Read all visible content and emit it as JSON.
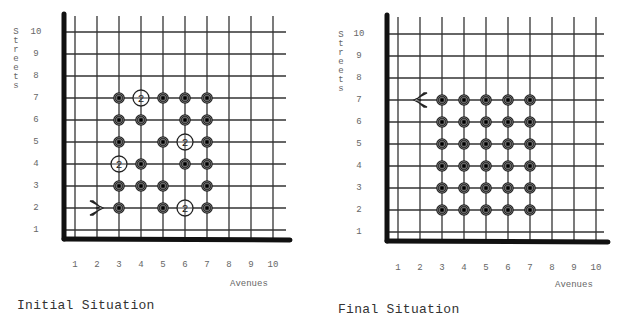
{
  "panels": {
    "initial": {
      "caption": "Initial Situation",
      "x_axis_title": "Avenues",
      "y_axis_title": "Streets",
      "x_ticks": [
        "1",
        "2",
        "3",
        "4",
        "5",
        "6",
        "7",
        "8",
        "9",
        "10"
      ],
      "y_ticks": [
        "1",
        "2",
        "3",
        "4",
        "5",
        "6",
        "7",
        "8",
        "9",
        "10"
      ],
      "robot": {
        "avenue": 2,
        "street": 2,
        "facing": "east",
        "icon": "robot-arrow-east-icon"
      },
      "beepers": [
        {
          "avenue": 3,
          "street": 7,
          "count": 1
        },
        {
          "avenue": 4,
          "street": 7,
          "count": 2
        },
        {
          "avenue": 5,
          "street": 7,
          "count": 1
        },
        {
          "avenue": 6,
          "street": 7,
          "count": 1
        },
        {
          "avenue": 7,
          "street": 7,
          "count": 1
        },
        {
          "avenue": 3,
          "street": 6,
          "count": 1
        },
        {
          "avenue": 4,
          "street": 6,
          "count": 1
        },
        {
          "avenue": 6,
          "street": 6,
          "count": 1
        },
        {
          "avenue": 7,
          "street": 6,
          "count": 1
        },
        {
          "avenue": 3,
          "street": 5,
          "count": 1
        },
        {
          "avenue": 5,
          "street": 5,
          "count": 1
        },
        {
          "avenue": 6,
          "street": 5,
          "count": 2
        },
        {
          "avenue": 7,
          "street": 5,
          "count": 1
        },
        {
          "avenue": 3,
          "street": 4,
          "count": 2
        },
        {
          "avenue": 4,
          "street": 4,
          "count": 1
        },
        {
          "avenue": 6,
          "street": 4,
          "count": 1
        },
        {
          "avenue": 7,
          "street": 4,
          "count": 1
        },
        {
          "avenue": 3,
          "street": 3,
          "count": 1
        },
        {
          "avenue": 4,
          "street": 3,
          "count": 1
        },
        {
          "avenue": 5,
          "street": 3,
          "count": 1
        },
        {
          "avenue": 7,
          "street": 3,
          "count": 1
        },
        {
          "avenue": 3,
          "street": 2,
          "count": 1
        },
        {
          "avenue": 5,
          "street": 2,
          "count": 1
        },
        {
          "avenue": 6,
          "street": 2,
          "count": 2
        },
        {
          "avenue": 7,
          "street": 2,
          "count": 1
        }
      ]
    },
    "final": {
      "caption": "Final Situation",
      "x_axis_title": "Avenues",
      "y_axis_title": "Streets",
      "x_ticks": [
        "1",
        "2",
        "3",
        "4",
        "5",
        "6",
        "7",
        "8",
        "9",
        "10"
      ],
      "y_ticks": [
        "1",
        "2",
        "3",
        "4",
        "5",
        "6",
        "7",
        "8",
        "9",
        "10"
      ],
      "robot": {
        "avenue": 2,
        "street": 7,
        "facing": "west",
        "icon": "robot-arrow-west-icon"
      },
      "beepers": [
        {
          "avenue": 3,
          "street": 7,
          "count": 1
        },
        {
          "avenue": 4,
          "street": 7,
          "count": 1
        },
        {
          "avenue": 5,
          "street": 7,
          "count": 1
        },
        {
          "avenue": 6,
          "street": 7,
          "count": 1
        },
        {
          "avenue": 7,
          "street": 7,
          "count": 1
        },
        {
          "avenue": 3,
          "street": 6,
          "count": 1
        },
        {
          "avenue": 4,
          "street": 6,
          "count": 1
        },
        {
          "avenue": 5,
          "street": 6,
          "count": 1
        },
        {
          "avenue": 6,
          "street": 6,
          "count": 1
        },
        {
          "avenue": 7,
          "street": 6,
          "count": 1
        },
        {
          "avenue": 3,
          "street": 5,
          "count": 1
        },
        {
          "avenue": 4,
          "street": 5,
          "count": 1
        },
        {
          "avenue": 5,
          "street": 5,
          "count": 1
        },
        {
          "avenue": 6,
          "street": 5,
          "count": 1
        },
        {
          "avenue": 7,
          "street": 5,
          "count": 1
        },
        {
          "avenue": 3,
          "street": 4,
          "count": 1
        },
        {
          "avenue": 4,
          "street": 4,
          "count": 1
        },
        {
          "avenue": 5,
          "street": 4,
          "count": 1
        },
        {
          "avenue": 6,
          "street": 4,
          "count": 1
        },
        {
          "avenue": 7,
          "street": 4,
          "count": 1
        },
        {
          "avenue": 3,
          "street": 3,
          "count": 1
        },
        {
          "avenue": 4,
          "street": 3,
          "count": 1
        },
        {
          "avenue": 5,
          "street": 3,
          "count": 1
        },
        {
          "avenue": 6,
          "street": 3,
          "count": 1
        },
        {
          "avenue": 7,
          "street": 3,
          "count": 1
        },
        {
          "avenue": 3,
          "street": 2,
          "count": 1
        },
        {
          "avenue": 4,
          "street": 2,
          "count": 1
        },
        {
          "avenue": 5,
          "street": 2,
          "count": 1
        },
        {
          "avenue": 6,
          "street": 2,
          "count": 1
        },
        {
          "avenue": 7,
          "street": 2,
          "count": 1
        }
      ]
    }
  },
  "colors": {
    "grid": "#333333",
    "axis": "#111111",
    "beeper": "#222222",
    "label": "#666666"
  }
}
